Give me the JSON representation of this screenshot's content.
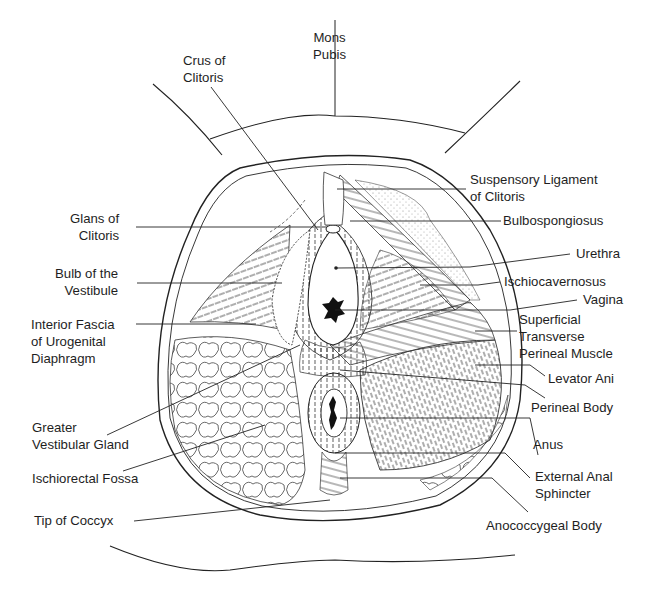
{
  "figure": {
    "line_color": "#222222",
    "background": "#ffffff"
  },
  "labels": {
    "mons_pubis": [
      "Mons",
      "Pubis"
    ],
    "crus_of_clitoris": [
      "Crus of",
      "Clitoris"
    ],
    "suspensory_ligament": [
      "Suspensory Ligament",
      "of Clitoris"
    ],
    "bulbospongiosus": [
      "Bulbospongiosus"
    ],
    "glans_of_clitoris": [
      "Glans of",
      "Clitoris"
    ],
    "bulb_of_vestibule": [
      "Bulb of the",
      "Vestibule"
    ],
    "urethra": [
      "Urethra"
    ],
    "ischiocavernosus": [
      "Ischiocavernosus"
    ],
    "interior_fascia": [
      "Interior Fascia",
      "of Urogenital",
      "Diaphragm"
    ],
    "vagina": [
      "Vagina"
    ],
    "superficial_transverse": [
      "Superficial",
      "Transverse",
      "Perineal Muscle"
    ],
    "levator_ani": [
      "Levator Ani"
    ],
    "perineal_body": [
      "Perineal Body"
    ],
    "greater_vestibular_gland": [
      "Greater",
      "Vestibular Gland"
    ],
    "anus": [
      "Anus"
    ],
    "ischiorectal_fossa": [
      "Ischiorectal Fossa"
    ],
    "external_anal_sphincter": [
      "External Anal",
      "Sphincter"
    ],
    "tip_of_coccyx": [
      "Tip of Coccyx"
    ],
    "anococcygeal_body": [
      "Anococcygeal Body"
    ]
  }
}
